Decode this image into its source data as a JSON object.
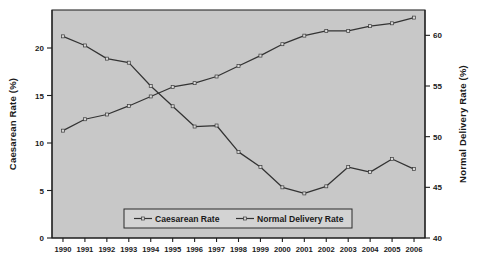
{
  "chart_data": {
    "type": "line",
    "title": "",
    "xlabel": "",
    "categories": [
      "1990",
      "1991",
      "1992",
      "1993",
      "1994",
      "1995",
      "1996",
      "1997",
      "1998",
      "1999",
      "2000",
      "2001",
      "2002",
      "2003",
      "2004",
      "2005",
      "2006"
    ],
    "grid": false,
    "legend_position": "bottom-center",
    "series": [
      {
        "name": "Caesarean Rate",
        "axis": "left",
        "ylabel": "Caesarean Rate (%)",
        "ylim": [
          0,
          24
        ],
        "yticks": [
          0,
          5,
          10,
          15,
          20
        ],
        "values": [
          11.3,
          12.5,
          13.0,
          13.9,
          14.9,
          15.9,
          16.3,
          17.0,
          18.1,
          19.2,
          20.4,
          21.3,
          21.8,
          21.8,
          22.3,
          22.6,
          23.2
        ]
      },
      {
        "name": "Normal Delivery Rate",
        "axis": "right",
        "ylabel": "Normal Delivery Rate (%)",
        "ylim": [
          40,
          62.5
        ],
        "yticks": [
          40,
          45,
          50,
          55,
          60
        ],
        "values": [
          59.9,
          59.0,
          57.7,
          57.3,
          55.0,
          53.0,
          51.0,
          51.1,
          48.5,
          47.0,
          45.0,
          44.4,
          45.1,
          47.0,
          46.5,
          47.8,
          46.8
        ]
      }
    ],
    "ylabel_left": "Caesarean Rate (%)",
    "ylabel_right": "Normal Delivery Rate (%)"
  },
  "legend": {
    "entries": [
      {
        "label": "Caesarean Rate"
      },
      {
        "label": "Normal Delivery Rate"
      }
    ]
  },
  "axes": {
    "left_title": "Caesarean Rate (%)",
    "right_title": "Normal Delivery Rate (%)",
    "left_ticks": [
      "0",
      "5",
      "10",
      "15",
      "20"
    ],
    "right_ticks": [
      "40",
      "45",
      "50",
      "55",
      "60"
    ],
    "x_ticks": [
      "1990",
      "1991",
      "1992",
      "1993",
      "1994",
      "1995",
      "1996",
      "1997",
      "1998",
      "1999",
      "2000",
      "2001",
      "2002",
      "2003",
      "2004",
      "2005",
      "2006"
    ]
  }
}
